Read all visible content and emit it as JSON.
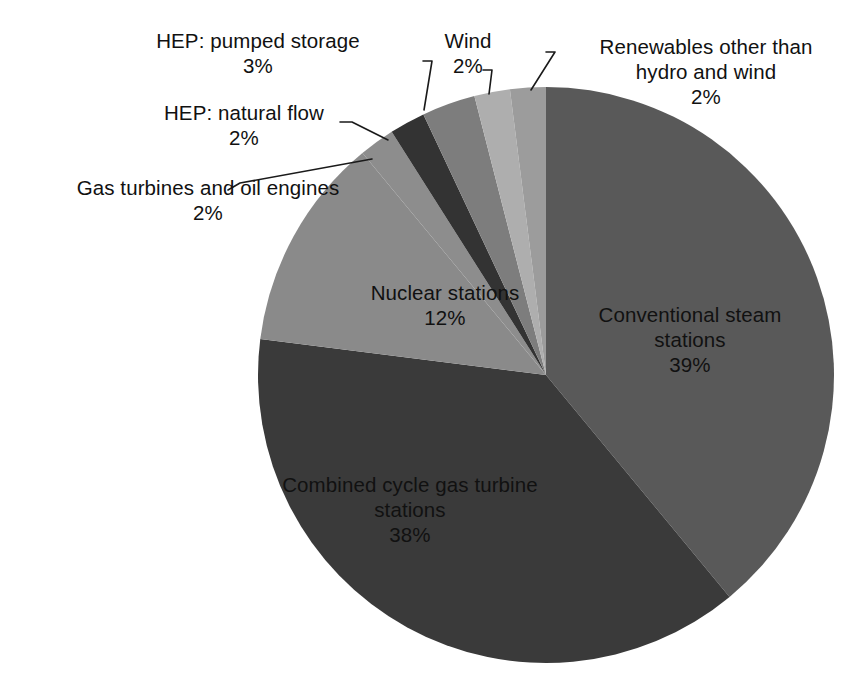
{
  "chart_data": {
    "type": "pie",
    "title": "",
    "subtitle": "",
    "xlabel": "",
    "ylabel": "",
    "legend_position": "none",
    "grid": false,
    "units": "percent",
    "start_angle_deg": 0,
    "direction": "clockwise",
    "categories": [
      "Conventional steam stations",
      "Combined cycle gas turbine stations",
      "Nuclear stations",
      "Gas turbines and oil engines",
      "HEP: natural flow",
      "HEP: pumped storage",
      "Wind",
      "Renewables other than hydro and wind"
    ],
    "values": [
      39,
      38,
      12,
      2,
      2,
      3,
      2,
      2
    ],
    "colors": [
      "#595959",
      "#3a3a3a",
      "#8a8a8a",
      "#8d8d8d",
      "#333333",
      "#7d7d7d",
      "#aeaeae",
      "#9c9c9c"
    ],
    "slices": [
      {
        "name": "Conventional steam stations",
        "label": "Conventional steam\nstations",
        "value": 39,
        "value_text": "39%",
        "color": "#595959",
        "label_placement": "inside"
      },
      {
        "name": "Combined cycle gas turbine stations",
        "label": "Combined cycle gas turbine\nstations",
        "value": 38,
        "value_text": "38%",
        "color": "#3a3a3a",
        "label_placement": "inside"
      },
      {
        "name": "Nuclear stations",
        "label": "Nuclear stations",
        "value": 12,
        "value_text": "12%",
        "color": "#8a8a8a",
        "label_placement": "inside"
      },
      {
        "name": "Gas turbines and oil engines",
        "label": "Gas turbines and oil engines",
        "value": 2,
        "value_text": "2%",
        "color": "#8d8d8d",
        "label_placement": "callout"
      },
      {
        "name": "HEP: natural flow",
        "label": "HEP: natural flow",
        "value": 2,
        "value_text": "2%",
        "color": "#333333",
        "label_placement": "callout"
      },
      {
        "name": "HEP: pumped storage",
        "label": "HEP: pumped storage",
        "value": 3,
        "value_text": "3%",
        "color": "#7d7d7d",
        "label_placement": "callout"
      },
      {
        "name": "Wind",
        "label": "Wind",
        "value": 2,
        "value_text": "2%",
        "color": "#aeaeae",
        "label_placement": "callout"
      },
      {
        "name": "Renewables other than hydro and wind",
        "label": "Renewables other than\nhydro and wind",
        "value": 2,
        "value_text": "2%",
        "color": "#9c9c9c",
        "label_placement": "callout"
      }
    ]
  },
  "labels": {
    "pumped_storage": "HEP: pumped storage\n3%",
    "wind": "Wind\n2%",
    "renewables": "Renewables other than\nhydro and wind\n2%",
    "natural_flow": "HEP: natural flow\n2%",
    "gas_turbines": "Gas turbines and oil engines\n2%",
    "nuclear": "Nuclear stations\n12%",
    "conventional": "Conventional steam\nstations\n39%",
    "ccgt": "Combined cycle gas turbine\nstations\n38%"
  },
  "palette": {
    "background": "#ffffff",
    "text": "#111111",
    "leader_line": "#1a1a1a",
    "conventional_steam": "#595959",
    "combined_cycle": "#3a3a3a",
    "nuclear": "#8a8a8a",
    "gas_turbines": "#8d8d8d",
    "hep_natural_flow": "#333333",
    "hep_pumped_storage": "#7d7d7d",
    "wind": "#aeaeae",
    "renewables_other": "#9c9c9c"
  }
}
